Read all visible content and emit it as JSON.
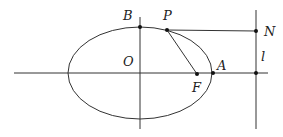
{
  "diagram": {
    "type": "ellipse-geometry",
    "stroke_color": "#333333",
    "labels": {
      "B": "B",
      "P": "P",
      "N": "N",
      "O": "O",
      "A": "A",
      "F": "F",
      "l": "l"
    },
    "points": {
      "B": [
        140,
        27
      ],
      "P": [
        167,
        30
      ],
      "N": [
        256,
        31
      ],
      "O": [
        140,
        73
      ],
      "F": [
        197,
        74
      ],
      "A": [
        213,
        73
      ],
      "l_axis": [
        256,
        73
      ]
    },
    "ellipse": {
      "cx": 140,
      "cy": 73,
      "rx": 72,
      "ry": 46
    },
    "segments": [
      {
        "name": "PN",
        "from": "P",
        "to": "N"
      },
      {
        "name": "PF",
        "from": "P",
        "to": "F"
      }
    ],
    "lines": [
      {
        "name": "x-axis",
        "from": [
          14,
          73
        ],
        "to": [
          268,
          73
        ]
      },
      {
        "name": "y-axis",
        "from": [
          140,
          17
        ],
        "to": [
          140,
          129
        ]
      },
      {
        "name": "directrix-l",
        "from": [
          256,
          10
        ],
        "to": [
          256,
          129
        ]
      }
    ]
  }
}
